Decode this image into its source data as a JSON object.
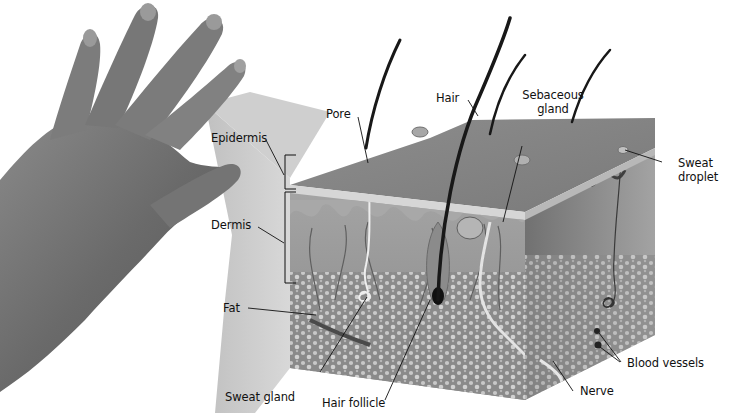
{
  "figure": {
    "colors": {
      "background": "#ffffff",
      "hand": "#6e6e6e",
      "magnifier_wedge": "#c9c9c9",
      "skin_surface": "#8a8a8a",
      "epidermis_band": "#d8d8d8",
      "dermis": "#9a9a9a",
      "fat": "#8f8f8f",
      "fat_cells": "#d4d4d4",
      "hair": "#1a1a1a",
      "leader_line": "#111111"
    }
  },
  "labels": {
    "epidermis": "Epidermis",
    "dermis": "Dermis",
    "fat": "Fat",
    "pore": "Pore",
    "hair": "Hair",
    "sebaceous_gland_line1": "Sebaceous",
    "sebaceous_gland_line2": "gland",
    "sweat_droplet_line1": "Sweat",
    "sweat_droplet_line2": "droplet",
    "blood_vessels": "Blood vessels",
    "nerve": "Nerve",
    "hair_follicle": "Hair follicle",
    "sweat_gland": "Sweat gland"
  }
}
